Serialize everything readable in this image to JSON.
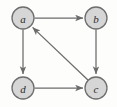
{
  "figure": {
    "type": "directed-graph",
    "background_color": "#fdfdfc",
    "node_fill_color": "#d6d6d6",
    "node_stroke_color": "#6e6e6e",
    "edge_color": "#6b6b6b",
    "label_color": "#2b2b2b"
  },
  "graph": {
    "node_radius": 11,
    "nodes": [
      {
        "id": "a",
        "label": "a",
        "cx": 23,
        "cy": 18
      },
      {
        "id": "b",
        "label": "b",
        "cx": 96,
        "cy": 18
      },
      {
        "id": "d",
        "label": "d",
        "cx": 23,
        "cy": 88
      },
      {
        "id": "c",
        "label": "c",
        "cx": 96,
        "cy": 88
      }
    ],
    "edges": [
      {
        "id": "a-b",
        "from": "a",
        "to": "b",
        "directed": true,
        "shape": "horizontal-top"
      },
      {
        "id": "a-d",
        "from": "a",
        "to": "d",
        "directed": true,
        "shape": "vertical-left"
      },
      {
        "id": "b-c",
        "from": "b",
        "to": "c",
        "directed": true,
        "shape": "vertical-right"
      },
      {
        "id": "d-c",
        "from": "d",
        "to": "c",
        "directed": true,
        "shape": "horizontal-bottom"
      },
      {
        "id": "c-a",
        "from": "c",
        "to": "a",
        "directed": true,
        "shape": "diagonal"
      }
    ]
  }
}
